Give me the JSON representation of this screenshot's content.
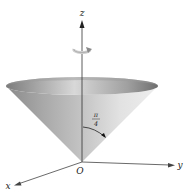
{
  "figure": {
    "axes": {
      "z_label": "z",
      "y_label": "y",
      "x_label": "x",
      "origin_label": "O"
    },
    "angle_label": {
      "numerator": "π",
      "denominator": "4"
    },
    "colors": {
      "cone_light": "#e6e6e6",
      "cone_mid": "#b5b5b5",
      "cone_dark": "#7a7a7a",
      "axis": "#333333",
      "rotation_arrow": "#d4d4d4"
    }
  }
}
